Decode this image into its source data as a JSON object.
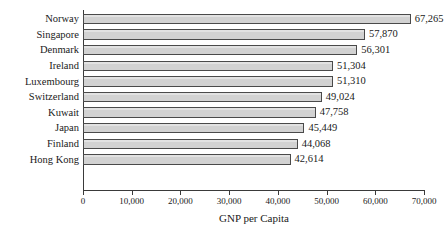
{
  "chart_data": {
    "type": "bar",
    "orientation": "horizontal",
    "title": "",
    "xlabel": "GNP per Capita",
    "ylabel": "",
    "categories": [
      "Norway",
      "Singapore",
      "Denmark",
      "Ireland",
      "Luxembourg",
      "Switzerland",
      "Kuwait",
      "Japan",
      "Finland",
      "Hong Kong"
    ],
    "values": [
      67265,
      57870,
      56301,
      51304,
      51310,
      49024,
      47758,
      45449,
      44068,
      42614
    ],
    "value_labels": [
      "67,265",
      "57,870",
      "56,301",
      "51,304",
      "51,310",
      "49,024",
      "47,758",
      "45,449",
      "44,068",
      "42,614"
    ],
    "xlim": [
      0,
      70000
    ],
    "xticks": [
      0,
      10000,
      20000,
      30000,
      40000,
      50000,
      60000,
      70000
    ],
    "xtick_labels": [
      "0",
      "10,000",
      "20,000",
      "30,000",
      "40,000",
      "50,000",
      "60,000",
      "70,000"
    ],
    "grid": false,
    "legend": null,
    "bar_fill_color": "#d2d2d2",
    "bar_border_color": "#4a4a4a",
    "axis_color": "#3a3a3a",
    "text_color": "#1a1a1a",
    "background_color": "#ffffff"
  }
}
